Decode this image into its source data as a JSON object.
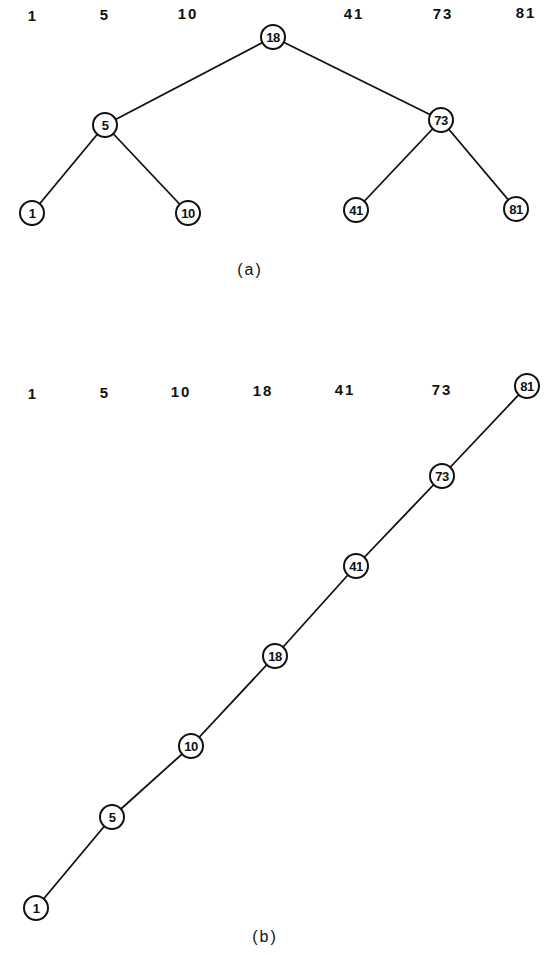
{
  "diagram_a": {
    "caption": "(a)",
    "keys": [
      "1",
      "5",
      "10",
      "18",
      "41",
      "73",
      "81"
    ],
    "nodes": {
      "n18": "18",
      "n5": "5",
      "n73": "73",
      "n1": "1",
      "n10": "10",
      "n41": "41",
      "n81": "81"
    },
    "edges": [
      [
        "18",
        "5"
      ],
      [
        "18",
        "73"
      ],
      [
        "5",
        "1"
      ],
      [
        "5",
        "10"
      ],
      [
        "73",
        "41"
      ],
      [
        "73",
        "81"
      ]
    ]
  },
  "diagram_b": {
    "caption": "(b)",
    "keys": [
      "1",
      "5",
      "10",
      "18",
      "41",
      "73"
    ],
    "nodes": {
      "n81": "81",
      "n73": "73",
      "n41": "41",
      "n18": "18",
      "n10": "10",
      "n5": "5",
      "n1": "1"
    },
    "edges": [
      [
        "81",
        "73"
      ],
      [
        "73",
        "41"
      ],
      [
        "41",
        "18"
      ],
      [
        "18",
        "10"
      ],
      [
        "10",
        "5"
      ],
      [
        "5",
        "1"
      ]
    ]
  }
}
